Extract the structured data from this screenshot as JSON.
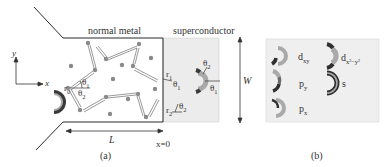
{
  "panel_a": {
    "caption": "(a)",
    "normal_region_label": "normal metal",
    "superconductor_region_label": "superconductor",
    "axis": {
      "y_label": "y",
      "x_label": "x"
    },
    "length_label": "L",
    "interface_label": "x=0",
    "width_label": "W",
    "angle_labels": {
      "r0": "r",
      "r0_sub": "0",
      "r1": "r",
      "r1_sub": "1",
      "r2": "r",
      "r2_sub": "2",
      "theta1": "θ",
      "theta1_sub": "1",
      "theta2": "θ",
      "theta2_sub": "2"
    },
    "colors": {
      "outline": "#2a2a2a",
      "superconductor_fill": "#ececec",
      "impurity": "#8a8a8a",
      "pair_light": "#a9a9a9",
      "pair_dark": "#3a3a3a"
    }
  },
  "panel_b": {
    "caption": "(b)",
    "symmetries": [
      {
        "label": "d",
        "sub": "xy"
      },
      {
        "label": "d",
        "sub": "x²−y²"
      },
      {
        "label": "p",
        "sub": "y"
      },
      {
        "label": "s",
        "sub": ""
      },
      {
        "label": "p",
        "sub": "x"
      }
    ]
  }
}
